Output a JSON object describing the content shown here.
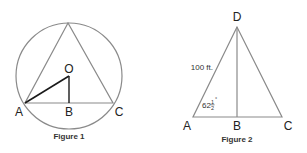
{
  "figures": [
    {
      "caption": "Figure 1",
      "labels": {
        "top": "",
        "O": "O",
        "A": "A",
        "B": "B",
        "C": "C"
      },
      "description": "Equilateral triangle inscribed in a circle with center O; segment OA and perpendicular OB to side AC"
    },
    {
      "caption": "Figure 2",
      "labels": {
        "D": "D",
        "A": "A",
        "B": "B",
        "C": "C"
      },
      "side_label": "100 ft.",
      "angle_label": {
        "whole": "62",
        "numerator": "1",
        "denominator": "2",
        "unit": "°"
      },
      "description": "Isosceles triangle ADC with altitude DB; side AD = 100 ft, angle A = 62½°"
    }
  ],
  "colors": {
    "outline": "#8a8a8a",
    "bold_line": "#1a1a1a",
    "text": "#222222"
  }
}
